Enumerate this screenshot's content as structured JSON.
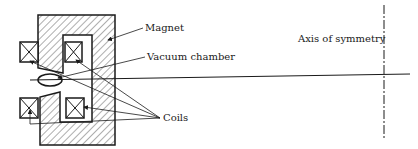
{
  "diagram": {
    "type": "cross-section schematic",
    "labels": {
      "magnet": "Magnet",
      "vacuum_chamber": "Vacuum chamber",
      "coils": "Coils",
      "axis": "Axis of symmetry"
    },
    "colors": {
      "line": "#1a1a1a",
      "background": "#ffffff"
    }
  }
}
